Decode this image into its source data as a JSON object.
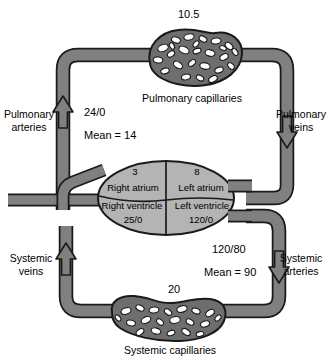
{
  "diagram": {
    "colors": {
      "vessel_fill": "#808080",
      "vessel_stroke": "#1a1a1a",
      "heart_fill": "#b4b4b4",
      "capillary_fill": "#6e6e6e",
      "lumen_fill": "#ffffff",
      "background": "#ffffff",
      "text": "#000000"
    }
  },
  "pulmonary": {
    "capillary_pressure": "10.5",
    "capillary_label": "Pulmonary capillaries",
    "artery_label": "Pulmonary\narteries",
    "artery_pressure": "24/0",
    "artery_mean": "Mean = 14",
    "vein_label": "Pulmonary\nveins"
  },
  "heart": {
    "right_atrium_pressure": "3",
    "right_atrium_label": "Right atrium",
    "left_atrium_pressure": "8",
    "left_atrium_label": "Left atrium",
    "right_ventricle_label": "Right ventricle",
    "right_ventricle_pressure": "25/0",
    "left_ventricle_label": "Left ventricle",
    "left_ventricle_pressure": "120/0"
  },
  "systemic": {
    "artery_pressure": "120/80",
    "artery_mean": "Mean = 90",
    "artery_label": "Systemic\narteries",
    "vein_label": "Systemic\nveins",
    "capillary_pressure": "20",
    "capillary_label": "Systemic capillaries"
  }
}
